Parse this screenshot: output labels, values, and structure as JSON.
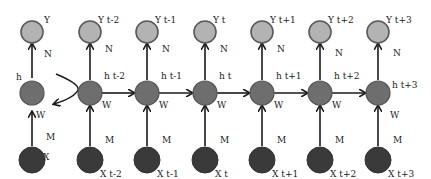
{
  "colors": {
    "output_node": "#b3b3b3",
    "hidden_node": "#6e6e6e",
    "input_node": "#3a3a3a",
    "edge": "#1a1a1a"
  },
  "folded": {
    "output_label": "Y",
    "hidden_label": "h",
    "input_label": "X",
    "weight_hidden_output": "N",
    "weight_input_hidden": "W",
    "weight_input": "M",
    "recurrent_arrow": "unfold-arrow"
  },
  "steps": [
    {
      "output": "Y t-2",
      "hidden": "h t-2",
      "input": "X t-2",
      "n": "N",
      "w_rec": "W",
      "m": "M"
    },
    {
      "output": "Y t-1",
      "hidden": "h t-1",
      "input": "X t-1",
      "n": "N",
      "w_rec": "W",
      "m": "M"
    },
    {
      "output": "Y t",
      "hidden": "h t",
      "input": "X t",
      "n": "N",
      "w_rec": "W",
      "m": "M"
    },
    {
      "output": "Y t+1",
      "hidden": "h t+1",
      "input": "X t+1",
      "n": "N",
      "w_rec": "W",
      "m": "M"
    },
    {
      "output": "Y t+2",
      "hidden": "h t+2",
      "input": "X t+2",
      "n": "N",
      "w_rec": "W",
      "m": "M"
    },
    {
      "output": "Y t+3",
      "hidden": "h t+3",
      "input": "X t+3",
      "n": "N",
      "w_rec": "W",
      "m": "M"
    }
  ]
}
